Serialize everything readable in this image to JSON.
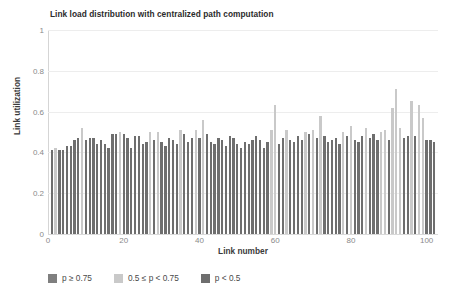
{
  "chart_data": {
    "type": "bar",
    "title": "Link load distribution with centralized path computation",
    "xlabel": "Link number",
    "ylabel": "Link utilization",
    "xlim": [
      0,
      103
    ],
    "ylim": [
      0,
      1
    ],
    "grid": "horizontal",
    "legend_position": "bottom",
    "xticks": [
      0,
      20,
      40,
      60,
      80,
      100
    ],
    "yticks": [
      "0",
      "0.2",
      "0.4",
      "0.6",
      "0.8",
      "1"
    ],
    "ytick_values": [
      0,
      0.2,
      0.4,
      0.6,
      0.8,
      1
    ],
    "colors": {
      "high": "#7f7f7f",
      "mid": "#c9c9c9",
      "low": "#6e6e6e"
    },
    "legend": [
      {
        "label": "p ≥ 0.75",
        "color": "#7f7f7f",
        "key": "high"
      },
      {
        "label": "0.5 ≤ p < 0.75",
        "color": "#c9c9c9",
        "key": "mid"
      },
      {
        "label": "p < 0.5",
        "color": "#6e6e6e",
        "key": "low"
      }
    ],
    "categories": [
      1,
      2,
      3,
      4,
      5,
      6,
      7,
      8,
      9,
      10,
      11,
      12,
      13,
      14,
      15,
      16,
      17,
      18,
      19,
      20,
      21,
      22,
      23,
      24,
      25,
      26,
      27,
      28,
      29,
      30,
      31,
      32,
      33,
      34,
      35,
      36,
      37,
      38,
      39,
      40,
      41,
      42,
      43,
      44,
      45,
      46,
      47,
      48,
      49,
      50,
      51,
      52,
      53,
      54,
      55,
      56,
      57,
      58,
      59,
      60,
      61,
      62,
      63,
      64,
      65,
      66,
      67,
      68,
      69,
      70,
      71,
      72,
      73,
      74,
      75,
      76,
      77,
      78,
      79,
      80,
      81,
      82,
      83,
      84,
      85,
      86,
      87,
      88,
      89,
      90,
      91,
      92,
      93,
      94,
      95,
      96,
      97,
      98,
      99,
      100,
      101,
      102
    ],
    "values": [
      0.41,
      0.42,
      0.41,
      0.41,
      0.43,
      0.43,
      0.46,
      0.47,
      0.52,
      0.46,
      0.47,
      0.47,
      0.44,
      0.46,
      0.44,
      0.42,
      0.49,
      0.49,
      0.5,
      0.49,
      0.47,
      0.42,
      0.48,
      0.48,
      0.44,
      0.45,
      0.5,
      0.46,
      0.5,
      0.45,
      0.43,
      0.47,
      0.46,
      0.44,
      0.51,
      0.49,
      0.45,
      0.47,
      0.51,
      0.47,
      0.56,
      0.49,
      0.45,
      0.44,
      0.47,
      0.46,
      0.43,
      0.48,
      0.47,
      0.44,
      0.42,
      0.45,
      0.44,
      0.46,
      0.48,
      0.46,
      0.42,
      0.45,
      0.51,
      0.63,
      0.44,
      0.47,
      0.51,
      0.46,
      0.45,
      0.48,
      0.46,
      0.5,
      0.49,
      0.51,
      0.47,
      0.58,
      0.48,
      0.45,
      0.46,
      0.47,
      0.44,
      0.5,
      0.48,
      0.53,
      0.46,
      0.45,
      0.48,
      0.52,
      0.47,
      0.49,
      0.46,
      0.5,
      0.51,
      0.46,
      0.62,
      0.71,
      0.52,
      0.47,
      0.48,
      0.65,
      0.48,
      0.63,
      0.57,
      0.46,
      0.46,
      0.45
    ],
    "classes": [
      "low",
      "mid",
      "low",
      "low",
      "low",
      "low",
      "low",
      "low",
      "mid",
      "low",
      "low",
      "low",
      "low",
      "low",
      "low",
      "low",
      "low",
      "low",
      "mid",
      "low",
      "low",
      "low",
      "low",
      "low",
      "low",
      "low",
      "mid",
      "low",
      "mid",
      "low",
      "low",
      "low",
      "low",
      "low",
      "mid",
      "low",
      "low",
      "low",
      "mid",
      "low",
      "mid",
      "low",
      "low",
      "low",
      "low",
      "low",
      "low",
      "low",
      "low",
      "low",
      "low",
      "low",
      "low",
      "low",
      "low",
      "low",
      "low",
      "low",
      "mid",
      "mid",
      "low",
      "low",
      "mid",
      "low",
      "low",
      "low",
      "low",
      "mid",
      "low",
      "mid",
      "low",
      "mid",
      "low",
      "low",
      "low",
      "low",
      "low",
      "mid",
      "low",
      "mid",
      "low",
      "low",
      "low",
      "mid",
      "low",
      "low",
      "low",
      "mid",
      "mid",
      "low",
      "mid",
      "mid",
      "mid",
      "low",
      "low",
      "mid",
      "low",
      "mid",
      "mid",
      "low",
      "low",
      "low"
    ]
  }
}
